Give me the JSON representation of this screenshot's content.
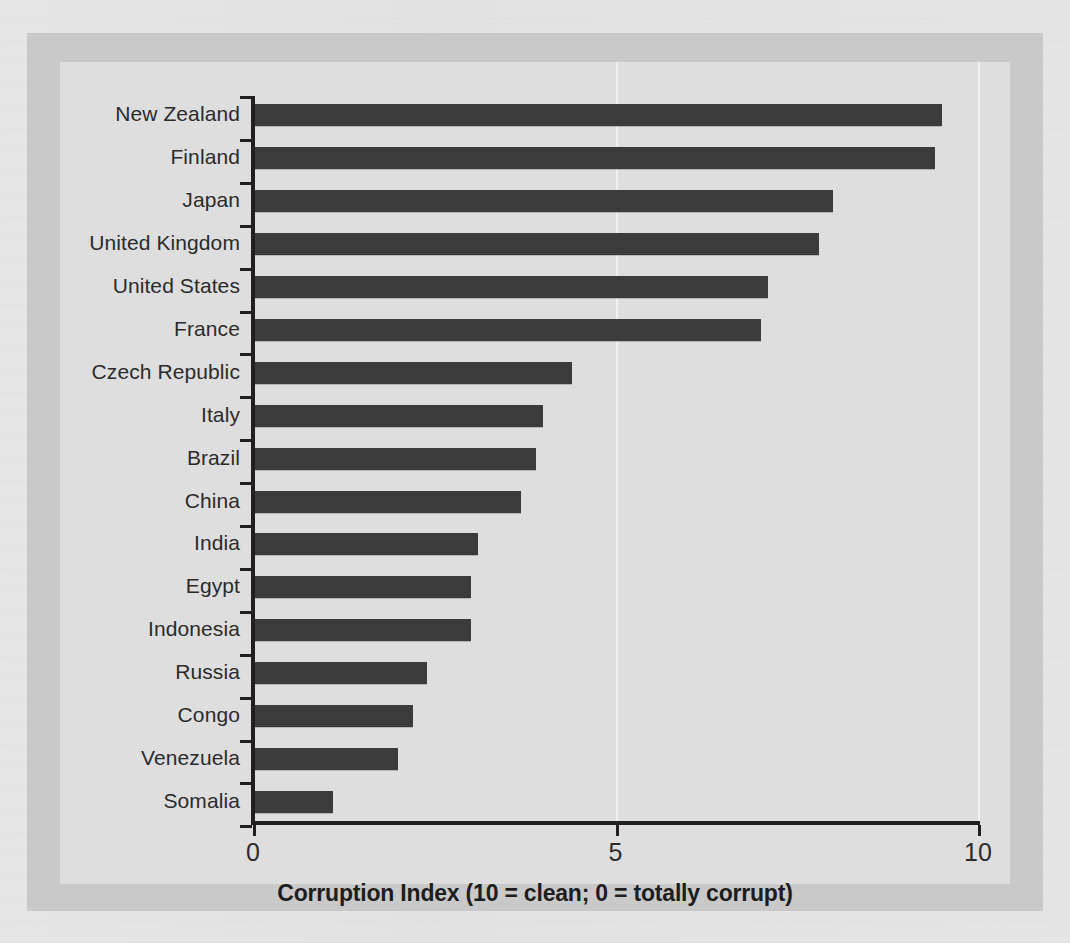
{
  "chart_data": {
    "type": "bar",
    "orientation": "horizontal",
    "title": "",
    "xlabel": "Corruption Index (10 = clean; 0 = totally corrupt)",
    "ylabel": "",
    "xlim": [
      0,
      10
    ],
    "xticks": [
      "0",
      "5",
      "10"
    ],
    "xtick_values": [
      0,
      5,
      10
    ],
    "grid": "vertical-faint",
    "legend": "none",
    "bar_color": "#3b3b3b",
    "categories": [
      "New Zealand",
      "Finland",
      "Japan",
      "United Kingdom",
      "United States",
      "France",
      "Czech Republic",
      "Italy",
      "Brazil",
      "China",
      "India",
      "Egypt",
      "Indonesia",
      "Russia",
      "Congo",
      "Venezuela",
      "Somalia"
    ],
    "values": [
      9.5,
      9.4,
      8.0,
      7.8,
      7.1,
      7.0,
      4.4,
      4.0,
      3.9,
      3.7,
      3.1,
      3.0,
      3.0,
      2.4,
      2.2,
      2.0,
      1.1
    ]
  },
  "colors": {
    "bar": "#3b3b3b",
    "axis": "#231f20",
    "panel_background": "#dedede",
    "frame_background": "#c9c9c9",
    "page_background": "#e4e4e4",
    "text": "#2b2b2b"
  }
}
